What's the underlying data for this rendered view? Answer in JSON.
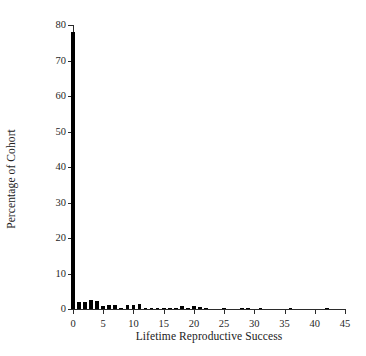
{
  "chart_data": {
    "type": "bar",
    "title": "",
    "subtitle": "",
    "xlabel": "Lifetime Reproductive Success",
    "ylabel": "Percentage of Cohort",
    "xlim": [
      0,
      45
    ],
    "ylim": [
      0,
      80
    ],
    "grid": false,
    "legend": null,
    "bar_color": "#000000",
    "axis_color": "#2b2b2b",
    "xticks": [
      0,
      5,
      10,
      15,
      20,
      25,
      30,
      35,
      40,
      45
    ],
    "xtick_labels": [
      "0",
      "5",
      "10",
      "15",
      "20",
      "25",
      "30",
      "35",
      "40",
      "45"
    ],
    "yticks": [
      0,
      10,
      20,
      30,
      40,
      50,
      60,
      70,
      80
    ],
    "ytick_labels": [
      "0",
      "10",
      "20",
      "30",
      "40",
      "50",
      "60",
      "70",
      "80"
    ],
    "categories": [
      0,
      1,
      2,
      3,
      4,
      5,
      6,
      7,
      8,
      9,
      10,
      11,
      12,
      13,
      14,
      15,
      16,
      17,
      18,
      19,
      20,
      21,
      22,
      23,
      24,
      25,
      26,
      27,
      28,
      29,
      30,
      31,
      32,
      33,
      34,
      35,
      36,
      37,
      38,
      39,
      40,
      41,
      42,
      43,
      44
    ],
    "values": [
      78.0,
      1.9,
      2.0,
      2.6,
      2.3,
      0.8,
      1.0,
      1.0,
      0.4,
      1.0,
      1.2,
      1.4,
      0.4,
      0.4,
      0.4,
      0.4,
      0.4,
      0.4,
      0.9,
      0.4,
      0.9,
      0.5,
      0.4,
      0.0,
      0.0,
      0.4,
      0.0,
      0.0,
      0.4,
      0.4,
      0.0,
      0.4,
      0.0,
      0.0,
      0.0,
      0.0,
      0.4,
      0.0,
      0.0,
      0.0,
      0.0,
      0.0,
      0.4,
      0.0,
      0.0
    ]
  }
}
